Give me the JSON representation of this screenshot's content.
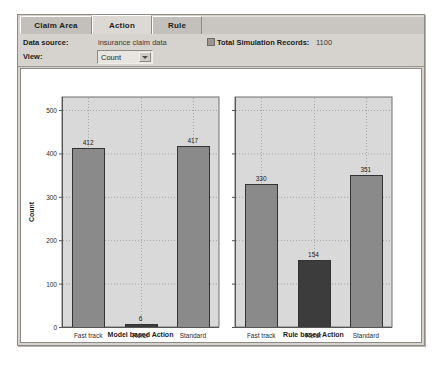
{
  "window": {
    "tabs": [
      {
        "label": "Claim Area",
        "selected": false
      },
      {
        "label": "Action",
        "selected": true
      },
      {
        "label": "Rule",
        "selected": false
      }
    ]
  },
  "info_bar": {
    "data_source_label": "Data source:",
    "data_source_value": "insurance claim data",
    "view_label": "View:",
    "view_value": "Count",
    "view_options": [
      "Count"
    ],
    "records_icon": "records-badge-icon",
    "total_records_label": "Total Simulation Records:",
    "total_records_value": "1100"
  },
  "colors": {
    "plot_background": "#d9d9d9",
    "bar_normal": "#8a8a8a",
    "bar_highlight": "#3c3c3c",
    "bar_outline": "#333333",
    "gridline": "#a6a6a6",
    "axis": "#555555",
    "window_face": "#d6d3ce"
  },
  "chart_data": [
    {
      "type": "bar",
      "id": "model-based-action",
      "title": "",
      "xlabel": "Model based Action",
      "ylabel": "Count",
      "categories": [
        "Fast track",
        "Refer Action",
        "Standard"
      ],
      "values": [
        412,
        6,
        417
      ],
      "highlight_index": 1,
      "ylim": [
        0,
        530
      ],
      "yticks": [
        0,
        100,
        200,
        300,
        400,
        500
      ],
      "ytick_labels": [
        "0",
        "100",
        "200",
        "300",
        "400",
        "500"
      ],
      "show_ytick_labels": true,
      "grid": true,
      "data_labels": [
        "412",
        "6",
        "417"
      ],
      "legend": "none"
    },
    {
      "type": "bar",
      "id": "rule-based-action",
      "title": "",
      "xlabel": "Rule based Action",
      "ylabel": "",
      "categories": [
        "Fast track",
        "Refer Action",
        "Standard"
      ],
      "values": [
        330,
        154,
        351
      ],
      "highlight_index": 1,
      "ylim": [
        0,
        530
      ],
      "yticks": [
        0,
        100,
        200,
        300,
        400,
        500
      ],
      "ytick_labels": [
        "",
        "",
        "",
        "",
        "",
        ""
      ],
      "show_ytick_labels": false,
      "grid": true,
      "data_labels": [
        "330",
        "154",
        "351"
      ],
      "legend": "none"
    }
  ]
}
